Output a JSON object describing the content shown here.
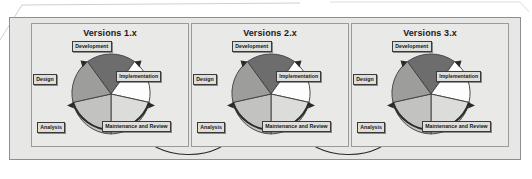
{
  "diagram": {
    "title_visible": false,
    "type": "iterative-lifecycle-wheels",
    "panels": [
      {
        "title": "Versions 1.x",
        "segments": [
          {
            "label": "Development",
            "color": "#6d6d6d"
          },
          {
            "label": "Implementation",
            "color": "#fdfdfd"
          },
          {
            "label": "Maintenance and Review",
            "color": "#dcdcda"
          },
          {
            "label": "Analysis",
            "color": "#c2c2c0"
          },
          {
            "label": "Design",
            "color": "#9d9d9b"
          }
        ]
      },
      {
        "title": "Versions 2.x",
        "segments": [
          {
            "label": "Development",
            "color": "#6d6d6d"
          },
          {
            "label": "Implementation",
            "color": "#fdfdfd"
          },
          {
            "label": "Maintenance and Review",
            "color": "#dcdcda"
          },
          {
            "label": "Analysis",
            "color": "#c2c2c0"
          },
          {
            "label": "Design",
            "color": "#9d9d9b"
          }
        ]
      },
      {
        "title": "Versions 3.x",
        "segments": [
          {
            "label": "Development",
            "color": "#6d6d6d"
          },
          {
            "label": "Implementation",
            "color": "#fdfdfd"
          },
          {
            "label": "Maintenance and Review",
            "color": "#dcdcda"
          },
          {
            "label": "Analysis",
            "color": "#c2c2c0"
          },
          {
            "label": "Design",
            "color": "#9d9d9b"
          }
        ]
      }
    ],
    "connectors": [
      {
        "from": "Versions 1.x",
        "to": "Versions 2.x"
      },
      {
        "from": "Versions 2.x",
        "to": "Versions 3.x"
      }
    ],
    "colors": {
      "page_background": "#ffffff",
      "outer_panel_fill": "#e7e7e5",
      "outer_panel_border": "#8e8e8e",
      "panel_fill": "#e9e9e7",
      "panel_border": "#9a9a9a",
      "label_fill": "#dededc",
      "label_border": "#3a3a3a",
      "wheel_outline": "#3c3c3c",
      "arrow_stroke": "#2b2b2b"
    }
  }
}
